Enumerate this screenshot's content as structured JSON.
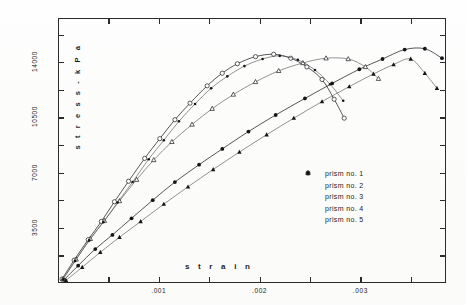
{
  "chart_data": {
    "type": "line",
    "title": "",
    "xlabel": "s t r a i n",
    "ylabel": "s t r e s s  -  k P a",
    "xlim": [
      0,
      0.00385
    ],
    "ylim": [
      0,
      16800
    ],
    "grid": false,
    "legend_position": "center-right",
    "xticks": [
      {
        "value": 0.001,
        "label": ".001"
      },
      {
        "value": 0.002,
        "label": ".002"
      },
      {
        "value": 0.003,
        "label": ".003"
      }
    ],
    "yticks": [
      {
        "value": 3500,
        "label": "3500"
      },
      {
        "value": 7000,
        "label": "7000"
      },
      {
        "value": 10500,
        "label": "10500"
      },
      {
        "value": 14000,
        "label": "14000"
      }
    ],
    "series": [
      {
        "name": "prism no. 1",
        "marker": "open-circle",
        "points": [
          [
            4e-05,
            250
          ],
          [
            0.00016,
            1450
          ],
          [
            0.0003,
            2750
          ],
          [
            0.00043,
            3900
          ],
          [
            0.00056,
            5150
          ],
          [
            0.0007,
            6450
          ],
          [
            0.00086,
            7900
          ],
          [
            0.00101,
            9150
          ],
          [
            0.00116,
            10350
          ],
          [
            0.00131,
            11400
          ],
          [
            0.00148,
            12500
          ],
          [
            0.00163,
            13300
          ],
          [
            0.00178,
            13900
          ],
          [
            0.00196,
            14350
          ],
          [
            0.00214,
            14500
          ],
          [
            0.00231,
            14250
          ],
          [
            0.00247,
            13700
          ],
          [
            0.00262,
            12900
          ],
          [
            0.00274,
            11650
          ],
          [
            0.00284,
            10450
          ]
        ]
      },
      {
        "name": "prism no. 2",
        "marker": "filled-circle",
        "points": [
          [
            6e-05,
            200
          ],
          [
            0.0002,
            1100
          ],
          [
            0.00037,
            2150
          ],
          [
            0.00054,
            3050
          ],
          [
            0.00073,
            4100
          ],
          [
            0.00094,
            5250
          ],
          [
            0.00116,
            6400
          ],
          [
            0.0014,
            7500
          ],
          [
            0.00163,
            8500
          ],
          [
            0.00189,
            9600
          ],
          [
            0.00216,
            10650
          ],
          [
            0.00245,
            11700
          ],
          [
            0.00272,
            12650
          ],
          [
            0.00299,
            13550
          ],
          [
            0.00322,
            14200
          ],
          [
            0.00344,
            14800
          ],
          [
            0.00364,
            14850
          ],
          [
            0.00381,
            14250
          ]
        ]
      },
      {
        "name": "prism no. 3",
        "marker": "open-triangle",
        "points": [
          [
            5e-05,
            260
          ],
          [
            0.00018,
            1500
          ],
          [
            0.00032,
            2800
          ],
          [
            0.00046,
            3950
          ],
          [
            0.00061,
            5200
          ],
          [
            0.00078,
            6550
          ],
          [
            0.00095,
            7800
          ],
          [
            0.00113,
            8950
          ],
          [
            0.00133,
            10050
          ],
          [
            0.00153,
            11050
          ],
          [
            0.00174,
            11950
          ],
          [
            0.00196,
            12750
          ],
          [
            0.00219,
            13450
          ],
          [
            0.00243,
            13950
          ],
          [
            0.00266,
            14250
          ],
          [
            0.00288,
            14200
          ],
          [
            0.00305,
            13700
          ],
          [
            0.00318,
            12950
          ]
        ]
      },
      {
        "name": "prism no. 4",
        "marker": "filled-triangle",
        "points": [
          [
            8e-05,
            170
          ],
          [
            0.00024,
            1000
          ],
          [
            0.00042,
            1950
          ],
          [
            0.00061,
            2900
          ],
          [
            0.00082,
            3900
          ],
          [
            0.00105,
            5000
          ],
          [
            0.00129,
            6100
          ],
          [
            0.00154,
            7200
          ],
          [
            0.0018,
            8300
          ],
          [
            0.00207,
            9400
          ],
          [
            0.00234,
            10450
          ],
          [
            0.00262,
            11500
          ],
          [
            0.00289,
            12450
          ],
          [
            0.00313,
            13250
          ],
          [
            0.00333,
            13850
          ],
          [
            0.0035,
            14200
          ],
          [
            0.00364,
            13300
          ],
          [
            0.00376,
            12350
          ]
        ]
      },
      {
        "name": "prism no. 5",
        "marker": "small-dot",
        "points": [
          [
            5e-05,
            230
          ],
          [
            0.00017,
            1400
          ],
          [
            0.00031,
            2700
          ],
          [
            0.00045,
            3850
          ],
          [
            0.00059,
            5100
          ],
          [
            0.00074,
            6400
          ],
          [
            0.0009,
            7850
          ],
          [
            0.00105,
            9050
          ],
          [
            0.0012,
            10250
          ],
          [
            0.00136,
            11350
          ],
          [
            0.00152,
            12350
          ],
          [
            0.00168,
            13100
          ],
          [
            0.00185,
            13750
          ],
          [
            0.00203,
            14200
          ],
          [
            0.0022,
            14400
          ],
          [
            0.00238,
            14150
          ],
          [
            0.00255,
            13500
          ],
          [
            0.0027,
            12600
          ],
          [
            0.00283,
            11550
          ]
        ]
      }
    ]
  },
  "legend": {
    "entries": [
      {
        "label": "prism no. 1",
        "marker": "open-circle"
      },
      {
        "label": "prism no. 2",
        "marker": "filled-circle"
      },
      {
        "label": "prism no. 3",
        "marker": "open-triangle"
      },
      {
        "label": "prism no. 4",
        "marker": "filled-triangle"
      },
      {
        "label": "prism no. 5",
        "marker": "small-dot"
      }
    ]
  },
  "axes": {
    "x_title": "s t r a i n",
    "y_title": "s t r e s s  -  k P a"
  }
}
